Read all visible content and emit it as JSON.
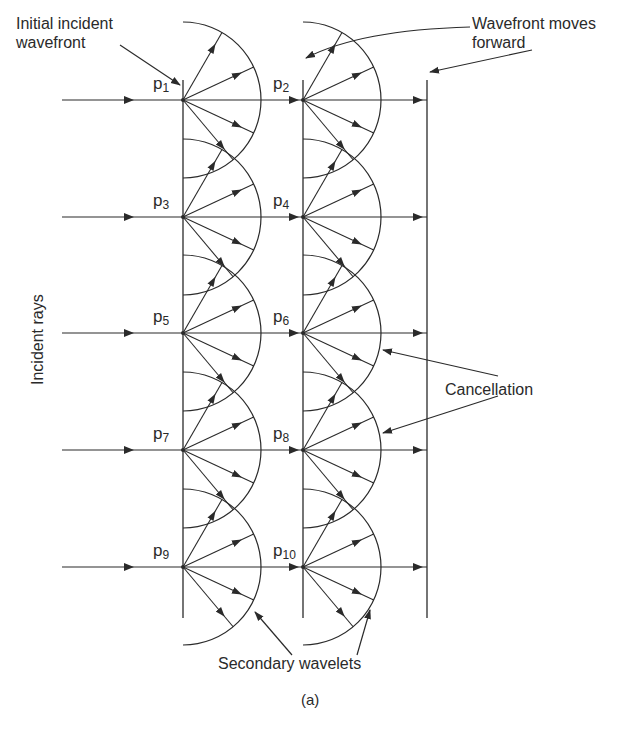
{
  "figure": {
    "caption": "(a)",
    "labels": {
      "initial_wavefront_line1": "Initial incident",
      "initial_wavefront_line2": "wavefront",
      "wavefront_moves_line1": "Wavefront moves",
      "wavefront_moves_line2": "forward",
      "incident_rays": "Incident rays",
      "cancellation": "Cancellation",
      "secondary_wavelets": "Secondary wavelets"
    },
    "points": [
      {
        "p": "p",
        "sub": "1",
        "col": 0,
        "row": 0
      },
      {
        "p": "p",
        "sub": "2",
        "col": 1,
        "row": 0
      },
      {
        "p": "p",
        "sub": "3",
        "col": 0,
        "row": 1
      },
      {
        "p": "p",
        "sub": "4",
        "col": 1,
        "row": 1
      },
      {
        "p": "p",
        "sub": "5",
        "col": 0,
        "row": 2
      },
      {
        "p": "p",
        "sub": "6",
        "col": 1,
        "row": 2
      },
      {
        "p": "p",
        "sub": "7",
        "col": 0,
        "row": 3
      },
      {
        "p": "p",
        "sub": "8",
        "col": 1,
        "row": 3
      },
      {
        "p": "p",
        "sub": "9",
        "col": 0,
        "row": 4
      },
      {
        "p": "p",
        "sub": "10",
        "col": 1,
        "row": 4
      }
    ],
    "geometry": {
      "wavefront_x": [
        183,
        303,
        427
      ],
      "wavefront_y_top": 80,
      "wavefront_y_bottom": 618,
      "row_y": [
        100,
        217,
        333,
        450,
        567
      ],
      "ray_start_x": 62,
      "wavelet_radius": 78,
      "wavelet_ray_angles_deg": [
        -60,
        -25,
        25,
        50
      ],
      "stroke_color": "#2a2a2a"
    }
  }
}
